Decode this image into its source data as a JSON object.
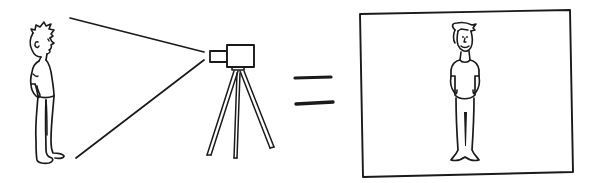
{
  "illustration": {
    "description": "A person is filmed by a video camera on a tripod; equals sign; the same person shown inside a screen frame",
    "colors": {
      "ink": "#1a1a1a",
      "background": "#ffffff"
    },
    "elements": [
      {
        "name": "subject-person",
        "icon": "standing-person-side-view"
      },
      {
        "name": "camera-field-of-view",
        "icon": "view-cone-lines"
      },
      {
        "name": "video-camera",
        "icon": "video-camera-icon"
      },
      {
        "name": "tripod",
        "icon": "tripod-icon"
      },
      {
        "name": "equals-sign",
        "icon": "equals-icon"
      },
      {
        "name": "screen-frame",
        "icon": "rectangle-frame"
      },
      {
        "name": "filmed-person",
        "icon": "standing-person-front-view"
      }
    ]
  }
}
